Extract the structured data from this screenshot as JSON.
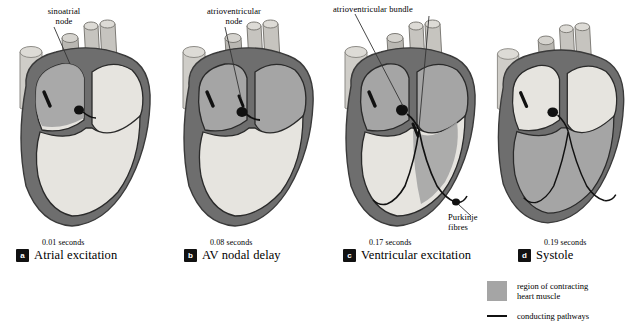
{
  "figure": {
    "background": "#ffffff"
  },
  "colors": {
    "contracting_muscle": "#a5a5a5",
    "resting_muscle": "#e6e4df",
    "myocardium_wall": "#6e6e6e",
    "vessel": "#cfcdc8",
    "conducting_pathway": "#111111",
    "text": "#000000"
  },
  "panels": [
    {
      "id": "a",
      "badge": "a",
      "seconds": "0.01 seconds",
      "title": "Atrial excitation",
      "annotations": [
        {
          "name": "sinoatrial-node",
          "text": "sinoatrial\nnode"
        }
      ]
    },
    {
      "id": "b",
      "badge": "b",
      "seconds": "0.08 seconds",
      "title": "AV nodal delay",
      "annotations": [
        {
          "name": "atrioventricular-node",
          "text": "atrioventricular\nnode"
        }
      ]
    },
    {
      "id": "c",
      "badge": "c",
      "seconds": "0.17 seconds",
      "title": "Ventricular excitation",
      "annotations": [
        {
          "name": "atrioventricular-bundle",
          "text": "atrioventricular bundle"
        },
        {
          "name": "purkinje-fibres",
          "text": "Purkinje\nfibres"
        }
      ]
    },
    {
      "id": "d",
      "badge": "d",
      "seconds": "0.19 seconds",
      "title": "Systole",
      "annotations": []
    }
  ],
  "legend": {
    "items": [
      {
        "symbol": "swatch",
        "text": "region of contracting\nheart muscle"
      },
      {
        "symbol": "line",
        "text": "conducting pathways"
      }
    ]
  }
}
